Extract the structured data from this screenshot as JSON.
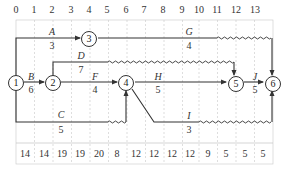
{
  "diagram": {
    "type": "time-scaled activity-on-arrow network",
    "time_scale": [
      "0",
      "1",
      "2",
      "3",
      "4",
      "5",
      "6",
      "7",
      "8",
      "9",
      "10",
      "11",
      "12",
      "13"
    ],
    "resource_row": [
      "14",
      "14",
      "19",
      "19",
      "20",
      "8",
      "12",
      "12",
      "12",
      "12",
      "9",
      "5",
      "5",
      "5"
    ],
    "nodes": [
      {
        "id": "1",
        "label": "1"
      },
      {
        "id": "2",
        "label": "2"
      },
      {
        "id": "3",
        "label": "3"
      },
      {
        "id": "4",
        "label": "4"
      },
      {
        "id": "5",
        "label": "5"
      },
      {
        "id": "6",
        "label": "6"
      }
    ],
    "activities": [
      {
        "name": "A",
        "duration": "3",
        "from": "1",
        "to": "3"
      },
      {
        "name": "B",
        "duration": "6",
        "from": "1",
        "to": "2"
      },
      {
        "name": "C",
        "duration": "5",
        "from": "1",
        "to": "4"
      },
      {
        "name": "D",
        "duration": "7",
        "from": "2",
        "to": "5"
      },
      {
        "name": "F",
        "duration": "4",
        "from": "2",
        "to": "4"
      },
      {
        "name": "G",
        "duration": "4",
        "from": "3",
        "to": "6"
      },
      {
        "name": "H",
        "duration": "5",
        "from": "4",
        "to": "5"
      },
      {
        "name": "I",
        "duration": "3",
        "from": "4",
        "to": "6"
      },
      {
        "name": "J",
        "duration": "5",
        "from": "5",
        "to": "6"
      }
    ],
    "colors": {
      "line": "#333333",
      "grid": "#bbbbbb",
      "background": "#ffffff"
    }
  }
}
